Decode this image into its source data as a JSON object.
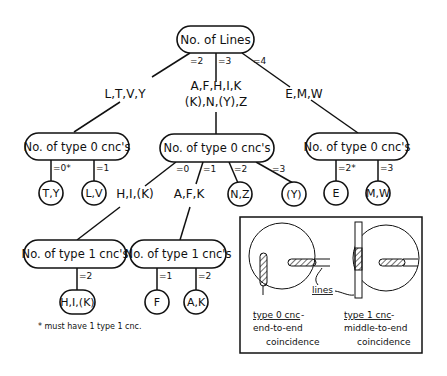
{
  "root": {
    "label": "No. of Lines"
  },
  "root_edges": {
    "e2": "=2",
    "e3": "=3",
    "e4": "=4"
  },
  "groups": {
    "left": "L,T,V,Y",
    "mid_line1": "A,F,H,I,K",
    "mid_line2": "(K),N,(Y),Z",
    "right": "E,M,W"
  },
  "type0_left": {
    "label": "No. of type 0 cnc's",
    "edges": {
      "e0": "=0*",
      "e1": "=1"
    },
    "leaves": {
      "a": "T,Y",
      "b": "L,V"
    }
  },
  "type0_mid": {
    "label": "No. of type 0 cnc's",
    "edges": {
      "e0": "=0",
      "e1": "=1",
      "e2": "=2",
      "e3": "=3"
    },
    "groups": {
      "g0": "H,I,(K)",
      "g1": "A,F,K"
    },
    "leaves": {
      "n2": "N,Z",
      "n3": "(Y)"
    }
  },
  "type0_right": {
    "label": "No. of type 0 cnc's",
    "edges": {
      "e2": "=2*",
      "e3": "=3"
    },
    "leaves": {
      "a": "E",
      "b": "M,W"
    }
  },
  "type1_left": {
    "label": "No. of type 1 cnc's",
    "edges": {
      "e2": "=2"
    },
    "leaves": {
      "a": "H,I,(K)"
    }
  },
  "type1_right": {
    "label": "No. of type 1 cnc's",
    "edges": {
      "e1": "=1",
      "e2": "=2"
    },
    "leaves": {
      "a": "F",
      "b": "A,K"
    }
  },
  "footnote": "* must have 1 type 1 cnc.",
  "legend": {
    "lines_label": "lines",
    "type0_title": "type 0 cnc",
    "type0_dash": "-",
    "type0_desc1": "end-to-end",
    "type0_desc2": "coincidence",
    "type1_title": "type 1 cnc",
    "type1_dash": "-",
    "type1_desc1": "middle-to-end",
    "type1_desc2": "coincidence"
  }
}
